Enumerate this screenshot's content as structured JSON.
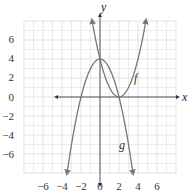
{
  "chart_data": {
    "type": "line",
    "title": "",
    "xlabel": "x",
    "ylabel": "y",
    "xlim": [
      -8,
      8
    ],
    "ylim": [
      -8,
      8
    ],
    "grid": true,
    "x_ticks": [
      -6,
      -4,
      -2,
      0,
      2,
      4,
      6
    ],
    "y_ticks": [
      6,
      4,
      2,
      0,
      -2,
      -4,
      -6
    ],
    "x_tick_labels": [
      "−6",
      "−4",
      "−2",
      "0",
      "2",
      "4",
      "6"
    ],
    "y_tick_labels": [
      "6",
      "4",
      "2",
      "0",
      "−2",
      "−4",
      "−6"
    ],
    "series": [
      {
        "name": "f",
        "formula": "f(x) = (x - 2)^2",
        "vertex": [
          2,
          0
        ],
        "x": [
          -0.83,
          0,
          1,
          2,
          3,
          4,
          4.83
        ],
        "y": [
          8,
          4,
          1,
          0,
          1,
          4,
          8
        ],
        "arrows": "both ends upward"
      },
      {
        "name": "g",
        "formula": "g(x) = 4 - x^2",
        "vertex": [
          0,
          4
        ],
        "x": [
          -3.46,
          -2,
          -1,
          0,
          1,
          2,
          3.46
        ],
        "y": [
          -8,
          0,
          3,
          4,
          3,
          0,
          -8
        ],
        "arrows": "both ends downward"
      }
    ],
    "annotations": [
      {
        "text": "f",
        "x": 3.8,
        "y": 1.8
      },
      {
        "text": "g",
        "x": 2.3,
        "y": -5.2
      }
    ]
  },
  "labels": {
    "x_axis": "x",
    "y_axis": "y",
    "f": "f",
    "g": "g",
    "xt0": "−6",
    "xt1": "−4",
    "xt2": "−2",
    "xt3": "0",
    "xt4": "2",
    "xt5": "4",
    "xt6": "6",
    "yt0": "6",
    "yt1": "4",
    "yt2": "2",
    "yt3": "0",
    "yt4": "−2",
    "yt5": "−4",
    "yt6": "−6"
  },
  "colors": {
    "curve": "#777777",
    "axis": "#555555",
    "grid": "#e4e4e4",
    "grid_major": "#d6d6d6"
  }
}
